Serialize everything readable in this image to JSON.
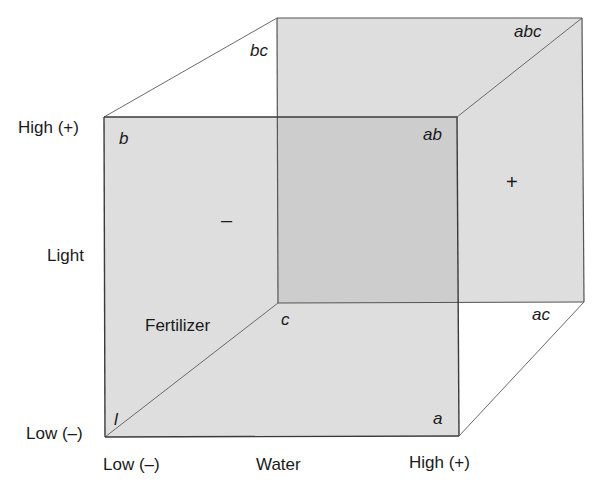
{
  "diagram": {
    "type": "2^3 factorial design cube",
    "factors": {
      "vertical": {
        "name": "Light",
        "low": "Low (–)",
        "high": "High (+)"
      },
      "horizontal": {
        "name": "Water",
        "low": "Low (–)",
        "high": "High (+)"
      },
      "depth": {
        "name": "Fertilizer"
      }
    },
    "corners": {
      "l": "l",
      "a": "a",
      "b": "b",
      "ab": "ab",
      "c": "c",
      "ac": "ac",
      "bc": "bc",
      "abc": "abc"
    },
    "face_signs": {
      "minus": "–",
      "plus": "+"
    },
    "colors": {
      "face_fill": "#dedede",
      "overlap_fill": "#cdcdcd",
      "edge": "#3a3a3a",
      "diag_edge": "#6a6a6a",
      "text": "#1a1a1a"
    }
  }
}
